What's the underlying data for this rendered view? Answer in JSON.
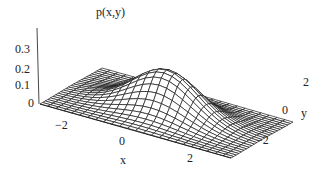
{
  "chart_data": {
    "type": "surface3d",
    "title": "p(x,y)",
    "xlabel": "x",
    "ylabel": "y",
    "zlabel": "p(x,y)",
    "function": "bivariate standard normal density p(x,y) = exp(-(x^2+y^2)/2) / (2*pi)",
    "x_range": [
      -3,
      3
    ],
    "y_range": [
      -3,
      3
    ],
    "z_range": [
      0,
      0.4
    ],
    "peak": {
      "x": 0,
      "y": 0,
      "z": 0.159
    },
    "x_ticks": [
      "-2",
      "0",
      "2"
    ],
    "y_ticks": [
      "-2",
      "0",
      "2"
    ],
    "z_ticks": [
      "0",
      "0.1",
      "0.2",
      "0.3"
    ],
    "mesh": {
      "rows": 24,
      "cols": 24,
      "style": "wireframe",
      "line_color": "#1a1a1a",
      "fill_color": "#ffffff"
    },
    "grid": false,
    "legend": null
  },
  "labels": {
    "title": "p(x,y)",
    "x_axis": "x",
    "y_axis": "y",
    "x_ticks": [
      "−2",
      "0",
      "2"
    ],
    "y_ticks": [
      "−2",
      "0",
      "2"
    ],
    "z_ticks": [
      "0",
      "0.1",
      "0.2",
      "0.3"
    ]
  }
}
